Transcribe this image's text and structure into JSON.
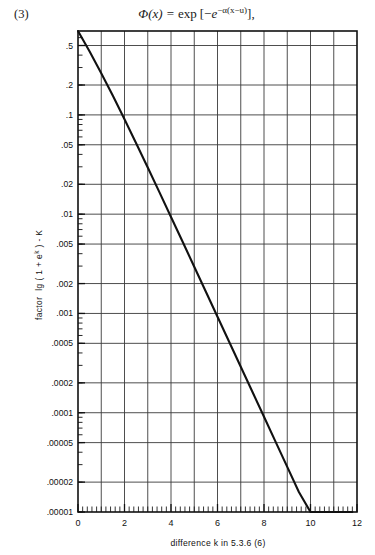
{
  "equation": {
    "number": "(3)",
    "plain": "Φ(x) = exp [−e^{−α(x−u)}] ,",
    "lhs": "Φ(x)",
    "eq": "=",
    "exp_word": "exp",
    "bracket_open": "[",
    "minus": "−",
    "base": "e",
    "exponent": "−α(x−u)",
    "bracket_close": "]",
    "comma": ","
  },
  "chart_data": {
    "type": "line",
    "title": "",
    "xlabel": "difference k in 5.3.6 (6)",
    "ylabel": "factor  lg ( 1 + eᵏ ) - K",
    "ylabel_parts": {
      "prefix": "factor",
      "expr_a": "lg ( 1 + e",
      "expr_sup": "k",
      "expr_b": " ) - K"
    },
    "xscale": "linear",
    "yscale": "log",
    "xlim": [
      0,
      12
    ],
    "ylim": [
      1e-05,
      0.7
    ],
    "grid": true,
    "legend": "none",
    "xticks": [
      0,
      2,
      4,
      6,
      8,
      10,
      12
    ],
    "xticklabels": [
      "0",
      "2",
      "4",
      "6",
      "8",
      "10",
      "12"
    ],
    "x_minor_step": 0.2,
    "x_gridlines": [
      1,
      2,
      3,
      4,
      5,
      6,
      7,
      8,
      9,
      10,
      11
    ],
    "yticks": [
      0.5,
      0.2,
      0.1,
      0.05,
      0.02,
      0.01,
      0.005,
      0.002,
      0.001,
      0.0005,
      0.0002,
      0.0001,
      5e-05,
      2e-05,
      1e-05
    ],
    "yticklabels": [
      ".5",
      ".2",
      ".1",
      ".05",
      ".02",
      ".01",
      ".005",
      ".002",
      ".001",
      ".0005",
      ".0002",
      ".0001",
      ".00005",
      ".00002",
      ".00001"
    ],
    "y_gridlines": [
      0.5,
      0.2,
      0.1,
      0.05,
      0.02,
      0.01,
      0.005,
      0.002,
      0.001,
      0.0005,
      0.0002,
      0.0001,
      5e-05,
      2e-05
    ],
    "series": [
      {
        "name": "lg(1+e^k) - K",
        "x": [
          0.0,
          0.5,
          1.0,
          1.5,
          2.0,
          2.5,
          3.0,
          3.5,
          4.0,
          4.5,
          5.0,
          5.5,
          6.0,
          6.5,
          7.0,
          7.5,
          8.0,
          8.5,
          9.0,
          9.5,
          10.0,
          10.5,
          11.0,
          11.5,
          11.8
        ],
        "y": [
          0.699,
          0.4343,
          0.2633,
          0.1558,
          0.0905,
          0.0519,
          0.0295,
          0.01666,
          0.00938,
          0.00527,
          0.002955,
          0.001656,
          0.000927,
          0.000519,
          0.0002905,
          0.0001626,
          9.1e-05,
          5.09e-05,
          2.85e-05,
          1.59e-05,
          8.89e-06,
          4.97e-06,
          2.78e-06,
          1.56e-06,
          1.15e-06
        ]
      }
    ]
  },
  "figure": {
    "plot_left_px": 78,
    "plot_right_px": 357,
    "plot_top_px": 31,
    "plot_bottom_px": 512
  }
}
